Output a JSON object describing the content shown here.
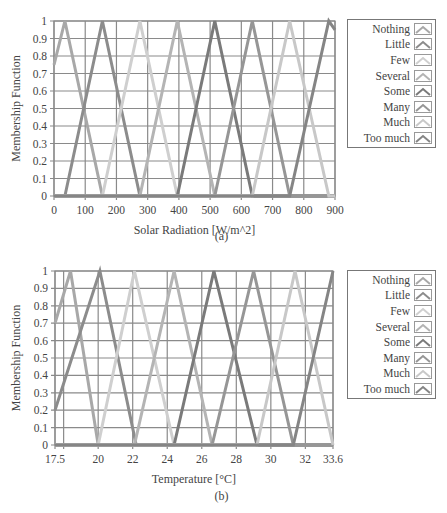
{
  "chart_data": [
    {
      "type": "line",
      "panel": "(a)",
      "title": "",
      "xlabel": "Solar Radiation [W/m^2]",
      "ylabel": "Membership Function",
      "xlim": [
        0,
        900
      ],
      "ylim": [
        0,
        1
      ],
      "x_ticks": [
        0,
        100,
        200,
        300,
        400,
        500,
        600,
        700,
        800,
        900
      ],
      "y_ticks": [
        0,
        0.1,
        0.2,
        0.3,
        0.4,
        0.5,
        0.6,
        0.7,
        0.8,
        0.9,
        1
      ],
      "grid": true,
      "legend_position": "right",
      "series": [
        {
          "name": "Nothing",
          "color": "#a8a8a8",
          "points": [
            [
              0,
              0.75
            ],
            [
              35,
              1
            ],
            [
              155,
              0
            ],
            [
              900,
              0
            ]
          ]
        },
        {
          "name": "Little",
          "color": "#8c8c8c",
          "points": [
            [
              0,
              0
            ],
            [
              35,
              0
            ],
            [
              155,
              1
            ],
            [
              275,
              0
            ],
            [
              900,
              0
            ]
          ]
        },
        {
          "name": "Few",
          "color": "#cfcfcf",
          "points": [
            [
              0,
              0
            ],
            [
              155,
              0
            ],
            [
              275,
              1
            ],
            [
              395,
              0
            ],
            [
              900,
              0
            ]
          ]
        },
        {
          "name": "Several",
          "color": "#b4b4b4",
          "points": [
            [
              0,
              0
            ],
            [
              275,
              0
            ],
            [
              395,
              1
            ],
            [
              515,
              0
            ],
            [
              900,
              0
            ]
          ]
        },
        {
          "name": "Some",
          "color": "#7a7a7a",
          "points": [
            [
              0,
              0
            ],
            [
              395,
              0
            ],
            [
              515,
              1
            ],
            [
              635,
              0
            ],
            [
              900,
              0
            ]
          ]
        },
        {
          "name": "Many",
          "color": "#969696",
          "points": [
            [
              0,
              0
            ],
            [
              515,
              0
            ],
            [
              635,
              1
            ],
            [
              755,
              0
            ],
            [
              900,
              0
            ]
          ]
        },
        {
          "name": "Much",
          "color": "#c8c8c8",
          "points": [
            [
              0,
              0
            ],
            [
              635,
              0
            ],
            [
              755,
              1
            ],
            [
              880,
              0
            ],
            [
              900,
              0
            ]
          ]
        },
        {
          "name": "Too much",
          "color": "#858585",
          "points": [
            [
              0,
              0
            ],
            [
              755,
              0
            ],
            [
              880,
              1
            ],
            [
              900,
              0.95
            ]
          ]
        }
      ]
    },
    {
      "type": "line",
      "panel": "(b)",
      "title": "",
      "xlabel": "Temperature [°C]",
      "ylabel": "Membership Function",
      "xlim": [
        17.5,
        33.6
      ],
      "ylim": [
        0,
        1
      ],
      "x_ticks": [
        17.5,
        20,
        22,
        24,
        26,
        28,
        30,
        32,
        33.6
      ],
      "y_ticks": [
        0,
        0.1,
        0.2,
        0.3,
        0.4,
        0.5,
        0.6,
        0.7,
        0.8,
        0.9,
        1
      ],
      "grid": true,
      "legend_position": "right",
      "series": [
        {
          "name": "Nothing",
          "color": "#a8a8a8",
          "points": [
            [
              17.5,
              0.7
            ],
            [
              18.4,
              1
            ],
            [
              20.0,
              0
            ],
            [
              33.6,
              0
            ]
          ]
        },
        {
          "name": "Little",
          "color": "#8c8c8c",
          "points": [
            [
              17.5,
              0.2
            ],
            [
              20.1,
              1
            ],
            [
              22.2,
              0
            ],
            [
              33.6,
              0
            ]
          ]
        },
        {
          "name": "Few",
          "color": "#cfcfcf",
          "points": [
            [
              17.5,
              0
            ],
            [
              20.0,
              0
            ],
            [
              22.1,
              1
            ],
            [
              24.4,
              0
            ],
            [
              33.6,
              0
            ]
          ]
        },
        {
          "name": "Several",
          "color": "#b4b4b4",
          "points": [
            [
              17.5,
              0
            ],
            [
              22.1,
              0
            ],
            [
              24.4,
              1
            ],
            [
              26.6,
              0
            ],
            [
              33.6,
              0
            ]
          ]
        },
        {
          "name": "Some",
          "color": "#7a7a7a",
          "points": [
            [
              17.5,
              0
            ],
            [
              24.4,
              0
            ],
            [
              26.7,
              1
            ],
            [
              29.2,
              0
            ],
            [
              33.6,
              0
            ]
          ]
        },
        {
          "name": "Many",
          "color": "#969696",
          "points": [
            [
              17.5,
              0
            ],
            [
              26.6,
              0
            ],
            [
              29.0,
              1
            ],
            [
              31.3,
              0
            ],
            [
              33.6,
              0
            ]
          ]
        },
        {
          "name": "Much",
          "color": "#c8c8c8",
          "points": [
            [
              17.5,
              0
            ],
            [
              29.2,
              0
            ],
            [
              31.4,
              1
            ],
            [
              33.6,
              0
            ]
          ]
        },
        {
          "name": "Too much",
          "color": "#858585",
          "points": [
            [
              17.5,
              0
            ],
            [
              31.3,
              0
            ],
            [
              33.6,
              1
            ]
          ]
        }
      ]
    }
  ],
  "captions": {
    "a": "(a)",
    "b": "(b)"
  },
  "legend": {
    "items": [
      "Nothing",
      "Little",
      "Few",
      "Several",
      "Some",
      "Many",
      "Much",
      "Too much"
    ]
  }
}
